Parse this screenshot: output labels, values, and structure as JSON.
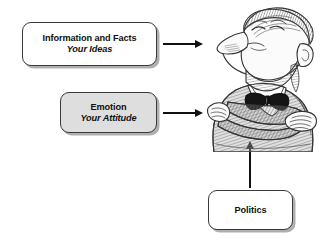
{
  "diagram": {
    "background_color": "#ffffff",
    "line_color": "#111111",
    "nodes": [
      {
        "id": "information-and-facts",
        "line1": "Information and Facts",
        "line2": "Your Ideas",
        "fill": "#ffffff",
        "border": "#3a3a3a",
        "shadow": "#6e6e6e"
      },
      {
        "id": "emotion",
        "line1": "Emotion",
        "line2": "Your Attitude",
        "fill": "#dedede",
        "border": "#3a3a3a",
        "shadow": "#6e6e6e"
      },
      {
        "id": "politics",
        "line1": "Politics",
        "line2": "",
        "fill": "#ffffff",
        "border": "#3a3a3a",
        "shadow": "#6e6e6e"
      }
    ],
    "connectors": [
      {
        "id": "arrow-information-to-figure",
        "direction": "right"
      },
      {
        "id": "arrow-emotion-to-figure",
        "direction": "right"
      },
      {
        "id": "arrow-politics-to-figure",
        "direction": "up"
      }
    ],
    "illustration": {
      "id": "skeptical-listener-cartoon",
      "description": "Cartoon man with beard, closed eyes, bow tie and crossed arms",
      "ink_color": "#333333",
      "skin_color": "#fbfbfb",
      "suit_color": "#a9a9a9",
      "hair_color": "#6b6b6b"
    }
  }
}
